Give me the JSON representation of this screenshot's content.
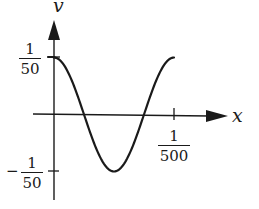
{
  "chart_data": {
    "type": "line",
    "title": "",
    "xlabel": "x",
    "ylabel": "y",
    "function": "y = (1/50) cos(1000*pi*x)",
    "x_ticks": [
      {
        "value": 0.002,
        "label_num": "1",
        "label_den": "500"
      }
    ],
    "y_ticks": [
      {
        "value": 0.02,
        "label_num": "1",
        "label_den": "50",
        "sign": ""
      },
      {
        "value": -0.02,
        "label_num": "1",
        "label_den": "50",
        "sign": "−"
      }
    ],
    "xlim": [
      0,
      0.002
    ],
    "ylim": [
      -0.02,
      0.02
    ],
    "grid": false,
    "legend": null,
    "series": [
      {
        "name": "y",
        "x": [
          0,
          0.00025,
          0.0005,
          0.001,
          0.0015,
          0.00175,
          0.002
        ],
        "values": [
          0.02,
          0.0141,
          0,
          -0.02,
          0,
          0.0141,
          0.02
        ]
      }
    ],
    "colors": {
      "line": "#1a1a1a",
      "axis": "#1a1a1a",
      "background": "#ffffff"
    }
  },
  "labels": {
    "x_axis": "x",
    "y_axis": "v",
    "top_num": "1",
    "top_den": "50",
    "bottom_sign": "−",
    "bottom_num": "1",
    "bottom_den": "50",
    "xtick_num": "1",
    "xtick_den": "500"
  }
}
